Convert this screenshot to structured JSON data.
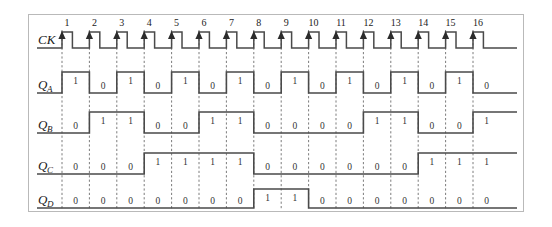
{
  "figure": {
    "title": "",
    "kind": "digital-timing-diagram",
    "frame_color": "#b9b9b9",
    "wave_color": "#4a4a4a",
    "grid_color": "#6d6d6d",
    "background": "#ffffff"
  },
  "clock": {
    "label": "CK",
    "edge": "rising",
    "pulse_markers": [
      "1",
      "2",
      "3",
      "4",
      "5",
      "6",
      "7",
      "8",
      "9",
      "10",
      "11",
      "12",
      "13",
      "14",
      "15",
      "16"
    ]
  },
  "signals": [
    {
      "name": "QA",
      "label_base": "Q",
      "label_sub": "A",
      "values": [
        "1",
        "0",
        "1",
        "0",
        "1",
        "0",
        "1",
        "0",
        "1",
        "0",
        "1",
        "0",
        "1",
        "0",
        "1",
        "0"
      ]
    },
    {
      "name": "QB",
      "label_base": "Q",
      "label_sub": "B",
      "values": [
        "0",
        "1",
        "1",
        "0",
        "0",
        "1",
        "1",
        "0",
        "0",
        "0",
        "0",
        "1",
        "1",
        "0",
        "0",
        "1"
      ]
    },
    {
      "name": "QC",
      "label_base": "Q",
      "label_sub": "C",
      "values": [
        "0",
        "0",
        "0",
        "1",
        "1",
        "1",
        "1",
        "0",
        "0",
        "0",
        "0",
        "0",
        "0",
        "1",
        "1",
        "1"
      ]
    },
    {
      "name": "QD",
      "label_base": "Q",
      "label_sub": "D",
      "values": [
        "0",
        "0",
        "0",
        "0",
        "0",
        "0",
        "0",
        "1",
        "1",
        "0",
        "0",
        "0",
        "0",
        "0",
        "0",
        "0"
      ]
    }
  ],
  "chart_data": {
    "type": "line",
    "title": "",
    "xlabel": "",
    "ylabel": "",
    "categories": [
      "1",
      "2",
      "3",
      "4",
      "5",
      "6",
      "7",
      "8",
      "9",
      "10",
      "11",
      "12",
      "13",
      "14",
      "15",
      "16"
    ],
    "series": [
      {
        "name": "CK",
        "values": [
          1,
          1,
          1,
          1,
          1,
          1,
          1,
          1,
          1,
          1,
          1,
          1,
          1,
          1,
          1,
          1
        ]
      },
      {
        "name": "QA",
        "values": [
          1,
          0,
          1,
          0,
          1,
          0,
          1,
          0,
          1,
          0,
          1,
          0,
          1,
          0,
          1,
          0
        ]
      },
      {
        "name": "QB",
        "values": [
          0,
          1,
          1,
          0,
          0,
          1,
          1,
          0,
          0,
          0,
          0,
          1,
          1,
          0,
          0,
          1
        ]
      },
      {
        "name": "QC",
        "values": [
          0,
          0,
          0,
          1,
          1,
          1,
          1,
          0,
          0,
          0,
          0,
          0,
          0,
          1,
          1,
          1
        ]
      },
      {
        "name": "QD",
        "values": [
          0,
          0,
          0,
          0,
          0,
          0,
          0,
          1,
          1,
          0,
          0,
          0,
          0,
          0,
          0,
          0
        ]
      }
    ],
    "grid": true,
    "legend": "none"
  }
}
